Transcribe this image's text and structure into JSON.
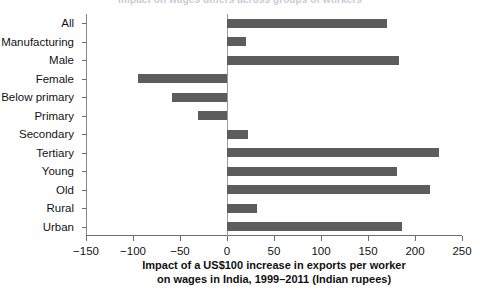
{
  "figure": {
    "clipped_header": "Impact on wages differs across groups of workers",
    "axis_title_line1": "Impact of a US$100 increase in exports per worker",
    "axis_title_line2": "on wages in India, 1999–2011 (Indian rupees)",
    "bar_color": "#5c5c5c",
    "axis_color": "#6e6e6e",
    "background": "#ffffff"
  },
  "chart_data": {
    "type": "bar",
    "orientation": "horizontal",
    "title": "",
    "xlabel": "Impact of a US$100 increase in exports per worker on wages in India, 1999–2011 (Indian rupees)",
    "ylabel": "",
    "xlim": [
      -150,
      250
    ],
    "ylim": null,
    "grid": false,
    "legend": null,
    "xticks": [
      -150,
      -100,
      -50,
      0,
      50,
      100,
      150,
      200,
      250
    ],
    "xtick_labels": [
      "−150",
      "−100",
      "−50",
      "0",
      "50",
      "100",
      "150",
      "200",
      "250"
    ],
    "categories": [
      "All",
      "Manufacturing",
      "Male",
      "Female",
      "Below primary",
      "Primary",
      "Secondary",
      "Tertiary",
      "Young",
      "Old",
      "Rural",
      "Urban"
    ],
    "values": [
      170,
      20,
      183,
      -95,
      -58,
      -31,
      22,
      225,
      181,
      216,
      32,
      186
    ],
    "series": [
      {
        "name": "Impact on wages (Indian rupees)",
        "values": [
          170,
          20,
          183,
          -95,
          -58,
          -31,
          22,
          225,
          181,
          216,
          32,
          186
        ]
      }
    ]
  }
}
